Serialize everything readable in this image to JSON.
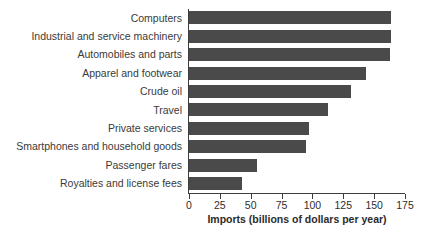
{
  "chart_data": {
    "type": "bar",
    "orientation": "horizontal",
    "title": "",
    "xlabel": "Imports (billions of dollars per year)",
    "ylabel": "",
    "xlim": [
      0,
      175
    ],
    "xticks": [
      0,
      25,
      50,
      75,
      100,
      125,
      150,
      175
    ],
    "xtick_labels": [
      "0",
      "25",
      "50",
      "75",
      "100",
      "125",
      "150",
      "175"
    ],
    "grid": false,
    "legend": null,
    "bar_color": "#4a4a4a",
    "axis_color": "#3d3d3d",
    "background": "#ffffff",
    "categories": [
      "Computers",
      "Industrial and service machinery",
      "Automobiles and parts",
      "Apparel and footwear",
      "Crude oil",
      "Travel",
      "Private services",
      "Smartphones and household goods",
      "Passenger fares",
      "Royalties and license fees"
    ],
    "values": [
      164,
      164,
      163,
      143,
      131,
      113,
      97,
      95,
      55,
      43
    ]
  }
}
